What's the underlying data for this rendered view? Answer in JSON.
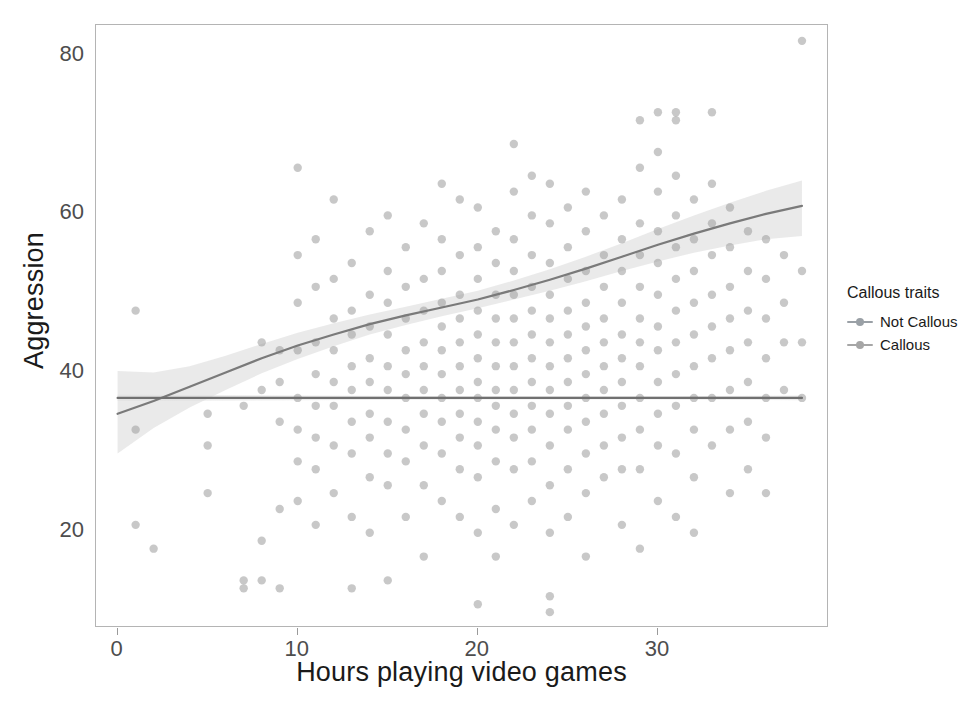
{
  "chart_data": {
    "type": "scatter",
    "title": "",
    "xlabel": "Hours playing video games",
    "ylabel": "Aggression",
    "xlim": [
      -1.2,
      39.5
    ],
    "ylim": [
      8,
      84
    ],
    "xticks": [
      0,
      10,
      20,
      30
    ],
    "yticks": [
      20,
      40,
      60,
      80
    ],
    "grid": false,
    "legend": {
      "title": "Callous traits",
      "position": "right",
      "entries": [
        {
          "label": "Not Callous",
          "color": "#9aa0a6",
          "marker": "line-point"
        },
        {
          "label": "Callous",
          "color": "#a6a6a6",
          "marker": "line-point"
        }
      ]
    },
    "point_style": {
      "color": "#9b9b9b",
      "opacity": 0.55,
      "radius": 4.2
    },
    "series": [
      {
        "name": "Not Callous",
        "fit": "loess",
        "line_color": "#7a7a7a",
        "ribbon_color": "#d9d9d9",
        "fit_points": [
          {
            "x": 0,
            "y": 35.0
          },
          {
            "x": 2,
            "y": 36.6
          },
          {
            "x": 4,
            "y": 38.4
          },
          {
            "x": 6,
            "y": 40.2
          },
          {
            "x": 8,
            "y": 42.0
          },
          {
            "x": 10,
            "y": 43.6
          },
          {
            "x": 12,
            "y": 45.0
          },
          {
            "x": 14,
            "y": 46.3
          },
          {
            "x": 16,
            "y": 47.4
          },
          {
            "x": 18,
            "y": 48.4
          },
          {
            "x": 20,
            "y": 49.4
          },
          {
            "x": 22,
            "y": 50.6
          },
          {
            "x": 24,
            "y": 51.9
          },
          {
            "x": 26,
            "y": 53.3
          },
          {
            "x": 28,
            "y": 54.8
          },
          {
            "x": 30,
            "y": 56.3
          },
          {
            "x": 32,
            "y": 57.7
          },
          {
            "x": 34,
            "y": 59.0
          },
          {
            "x": 36,
            "y": 60.2
          },
          {
            "x": 38,
            "y": 61.2
          }
        ],
        "ribbon_lower": [
          {
            "x": 0,
            "y": 30.0
          },
          {
            "x": 2,
            "y": 33.2
          },
          {
            "x": 4,
            "y": 35.8
          },
          {
            "x": 6,
            "y": 38.0
          },
          {
            "x": 8,
            "y": 40.1
          },
          {
            "x": 10,
            "y": 41.9
          },
          {
            "x": 12,
            "y": 43.5
          },
          {
            "x": 14,
            "y": 45.0
          },
          {
            "x": 16,
            "y": 46.2
          },
          {
            "x": 18,
            "y": 47.3
          },
          {
            "x": 20,
            "y": 48.3
          },
          {
            "x": 22,
            "y": 49.4
          },
          {
            "x": 24,
            "y": 50.5
          },
          {
            "x": 26,
            "y": 51.7
          },
          {
            "x": 28,
            "y": 53.0
          },
          {
            "x": 30,
            "y": 54.2
          },
          {
            "x": 32,
            "y": 55.3
          },
          {
            "x": 34,
            "y": 56.2
          },
          {
            "x": 36,
            "y": 57.0
          },
          {
            "x": 38,
            "y": 57.4
          }
        ],
        "ribbon_upper": [
          {
            "x": 0,
            "y": 40.4
          },
          {
            "x": 2,
            "y": 40.2
          },
          {
            "x": 4,
            "y": 41.0
          },
          {
            "x": 6,
            "y": 42.3
          },
          {
            "x": 8,
            "y": 43.8
          },
          {
            "x": 10,
            "y": 45.2
          },
          {
            "x": 12,
            "y": 46.4
          },
          {
            "x": 14,
            "y": 47.5
          },
          {
            "x": 16,
            "y": 48.5
          },
          {
            "x": 18,
            "y": 49.5
          },
          {
            "x": 20,
            "y": 50.5
          },
          {
            "x": 22,
            "y": 51.8
          },
          {
            "x": 24,
            "y": 53.2
          },
          {
            "x": 26,
            "y": 54.8
          },
          {
            "x": 28,
            "y": 56.5
          },
          {
            "x": 30,
            "y": 58.3
          },
          {
            "x": 32,
            "y": 60.0
          },
          {
            "x": 34,
            "y": 61.6
          },
          {
            "x": 36,
            "y": 63.1
          },
          {
            "x": 38,
            "y": 64.4
          }
        ]
      },
      {
        "name": "Callous",
        "fit": "loess",
        "line_color": "#707070",
        "ribbon_color": "#dedede",
        "fit_points": [
          {
            "x": 0,
            "y": 37.0
          },
          {
            "x": 5,
            "y": 37.0
          },
          {
            "x": 10,
            "y": 37.0
          },
          {
            "x": 15,
            "y": 37.0
          },
          {
            "x": 20,
            "y": 37.0
          },
          {
            "x": 25,
            "y": 37.0
          },
          {
            "x": 30,
            "y": 37.0
          },
          {
            "x": 35,
            "y": 37.0
          },
          {
            "x": 38,
            "y": 37.0
          }
        ],
        "ribbon_lower": [
          {
            "x": 0,
            "y": 36.6
          },
          {
            "x": 10,
            "y": 36.7
          },
          {
            "x": 20,
            "y": 36.8
          },
          {
            "x": 30,
            "y": 36.8
          },
          {
            "x": 38,
            "y": 36.7
          }
        ],
        "ribbon_upper": [
          {
            "x": 0,
            "y": 37.4
          },
          {
            "x": 10,
            "y": 37.3
          },
          {
            "x": 20,
            "y": 37.2
          },
          {
            "x": 30,
            "y": 37.2
          },
          {
            "x": 38,
            "y": 37.3
          }
        ]
      }
    ],
    "points": [
      [
        1,
        33
      ],
      [
        1,
        21
      ],
      [
        1,
        48
      ],
      [
        2,
        18
      ],
      [
        5,
        35
      ],
      [
        5,
        31
      ],
      [
        5,
        25
      ],
      [
        7,
        36
      ],
      [
        7,
        14
      ],
      [
        7,
        13
      ],
      [
        8,
        44
      ],
      [
        8,
        38
      ],
      [
        8,
        19
      ],
      [
        8,
        14
      ],
      [
        9,
        43
      ],
      [
        9,
        39
      ],
      [
        9,
        34
      ],
      [
        9,
        23
      ],
      [
        9,
        13
      ],
      [
        10,
        66
      ],
      [
        10,
        55
      ],
      [
        10,
        49
      ],
      [
        10,
        43
      ],
      [
        10,
        37
      ],
      [
        10,
        33
      ],
      [
        10,
        29
      ],
      [
        10,
        24
      ],
      [
        11,
        57
      ],
      [
        11,
        51
      ],
      [
        11,
        44
      ],
      [
        11,
        40
      ],
      [
        11,
        36
      ],
      [
        11,
        32
      ],
      [
        11,
        28
      ],
      [
        11,
        21
      ],
      [
        12,
        62
      ],
      [
        12,
        52
      ],
      [
        12,
        47
      ],
      [
        12,
        43
      ],
      [
        12,
        39
      ],
      [
        12,
        36
      ],
      [
        12,
        31
      ],
      [
        12,
        25
      ],
      [
        13,
        54
      ],
      [
        13,
        48
      ],
      [
        13,
        45
      ],
      [
        13,
        41
      ],
      [
        13,
        38
      ],
      [
        13,
        34
      ],
      [
        13,
        30
      ],
      [
        13,
        22
      ],
      [
        13,
        13
      ],
      [
        14,
        58
      ],
      [
        14,
        50
      ],
      [
        14,
        46
      ],
      [
        14,
        42
      ],
      [
        14,
        39
      ],
      [
        14,
        35
      ],
      [
        14,
        32
      ],
      [
        14,
        27
      ],
      [
        14,
        20
      ],
      [
        15,
        60
      ],
      [
        15,
        53
      ],
      [
        15,
        49
      ],
      [
        15,
        45
      ],
      [
        15,
        41
      ],
      [
        15,
        38
      ],
      [
        15,
        34
      ],
      [
        15,
        30
      ],
      [
        15,
        26
      ],
      [
        15,
        14
      ],
      [
        16,
        56
      ],
      [
        16,
        51
      ],
      [
        16,
        47
      ],
      [
        16,
        43
      ],
      [
        16,
        40
      ],
      [
        16,
        37
      ],
      [
        16,
        33
      ],
      [
        16,
        29
      ],
      [
        16,
        22
      ],
      [
        17,
        59
      ],
      [
        17,
        52
      ],
      [
        17,
        48
      ],
      [
        17,
        44
      ],
      [
        17,
        41
      ],
      [
        17,
        38
      ],
      [
        17,
        35
      ],
      [
        17,
        31
      ],
      [
        17,
        26
      ],
      [
        17,
        17
      ],
      [
        18,
        64
      ],
      [
        18,
        57
      ],
      [
        18,
        53
      ],
      [
        18,
        49
      ],
      [
        18,
        46
      ],
      [
        18,
        43
      ],
      [
        18,
        40
      ],
      [
        18,
        37
      ],
      [
        18,
        34
      ],
      [
        18,
        30
      ],
      [
        18,
        24
      ],
      [
        19,
        62
      ],
      [
        19,
        55
      ],
      [
        19,
        50
      ],
      [
        19,
        47
      ],
      [
        19,
        44
      ],
      [
        19,
        41
      ],
      [
        19,
        38
      ],
      [
        19,
        35
      ],
      [
        19,
        32
      ],
      [
        19,
        28
      ],
      [
        19,
        22
      ],
      [
        20,
        61
      ],
      [
        20,
        56
      ],
      [
        20,
        52
      ],
      [
        20,
        48
      ],
      [
        20,
        45
      ],
      [
        20,
        42
      ],
      [
        20,
        39
      ],
      [
        20,
        37
      ],
      [
        20,
        34
      ],
      [
        20,
        31
      ],
      [
        20,
        27
      ],
      [
        20,
        20
      ],
      [
        20,
        11
      ],
      [
        21,
        58
      ],
      [
        21,
        54
      ],
      [
        21,
        50
      ],
      [
        21,
        47
      ],
      [
        21,
        44
      ],
      [
        21,
        41
      ],
      [
        21,
        38
      ],
      [
        21,
        36
      ],
      [
        21,
        33
      ],
      [
        21,
        29
      ],
      [
        21,
        23
      ],
      [
        21,
        17
      ],
      [
        22,
        69
      ],
      [
        22,
        63
      ],
      [
        22,
        57
      ],
      [
        22,
        53
      ],
      [
        22,
        50
      ],
      [
        22,
        47
      ],
      [
        22,
        44
      ],
      [
        22,
        41
      ],
      [
        22,
        38
      ],
      [
        22,
        35
      ],
      [
        22,
        32
      ],
      [
        22,
        28
      ],
      [
        22,
        21
      ],
      [
        23,
        65
      ],
      [
        23,
        60
      ],
      [
        23,
        55
      ],
      [
        23,
        51
      ],
      [
        23,
        48
      ],
      [
        23,
        45
      ],
      [
        23,
        42
      ],
      [
        23,
        39
      ],
      [
        23,
        36
      ],
      [
        23,
        33
      ],
      [
        23,
        29
      ],
      [
        23,
        24
      ],
      [
        24,
        64
      ],
      [
        24,
        59
      ],
      [
        24,
        54
      ],
      [
        24,
        50
      ],
      [
        24,
        47
      ],
      [
        24,
        44
      ],
      [
        24,
        41
      ],
      [
        24,
        38
      ],
      [
        24,
        35
      ],
      [
        24,
        31
      ],
      [
        24,
        26
      ],
      [
        24,
        20
      ],
      [
        24,
        12
      ],
      [
        24,
        10
      ],
      [
        25,
        61
      ],
      [
        25,
        56
      ],
      [
        25,
        52
      ],
      [
        25,
        48
      ],
      [
        25,
        45
      ],
      [
        25,
        42
      ],
      [
        25,
        39
      ],
      [
        25,
        36
      ],
      [
        25,
        33
      ],
      [
        25,
        28
      ],
      [
        25,
        22
      ],
      [
        26,
        63
      ],
      [
        26,
        58
      ],
      [
        26,
        53
      ],
      [
        26,
        49
      ],
      [
        26,
        46
      ],
      [
        26,
        43
      ],
      [
        26,
        40
      ],
      [
        26,
        37
      ],
      [
        26,
        34
      ],
      [
        26,
        30
      ],
      [
        26,
        25
      ],
      [
        26,
        17
      ],
      [
        27,
        60
      ],
      [
        27,
        55
      ],
      [
        27,
        51
      ],
      [
        27,
        47
      ],
      [
        27,
        44
      ],
      [
        27,
        41
      ],
      [
        27,
        38
      ],
      [
        27,
        35
      ],
      [
        27,
        31
      ],
      [
        27,
        27
      ],
      [
        28,
        62
      ],
      [
        28,
        57
      ],
      [
        28,
        53
      ],
      [
        28,
        49
      ],
      [
        28,
        45
      ],
      [
        28,
        42
      ],
      [
        28,
        39
      ],
      [
        28,
        36
      ],
      [
        28,
        32
      ],
      [
        28,
        28
      ],
      [
        28,
        21
      ],
      [
        29,
        72
      ],
      [
        29,
        66
      ],
      [
        29,
        59
      ],
      [
        29,
        55
      ],
      [
        29,
        51
      ],
      [
        29,
        47
      ],
      [
        29,
        44
      ],
      [
        29,
        41
      ],
      [
        29,
        37
      ],
      [
        29,
        33
      ],
      [
        29,
        28
      ],
      [
        29,
        18
      ],
      [
        30,
        73
      ],
      [
        30,
        68
      ],
      [
        30,
        63
      ],
      [
        30,
        58
      ],
      [
        30,
        54
      ],
      [
        30,
        50
      ],
      [
        30,
        46
      ],
      [
        30,
        43
      ],
      [
        30,
        39
      ],
      [
        30,
        35
      ],
      [
        30,
        31
      ],
      [
        30,
        24
      ],
      [
        31,
        73
      ],
      [
        31,
        72
      ],
      [
        31,
        65
      ],
      [
        31,
        60
      ],
      [
        31,
        56
      ],
      [
        31,
        52
      ],
      [
        31,
        48
      ],
      [
        31,
        44
      ],
      [
        31,
        40
      ],
      [
        31,
        36
      ],
      [
        31,
        30
      ],
      [
        31,
        22
      ],
      [
        32,
        62
      ],
      [
        32,
        57
      ],
      [
        32,
        53
      ],
      [
        32,
        49
      ],
      [
        32,
        45
      ],
      [
        32,
        41
      ],
      [
        32,
        37
      ],
      [
        32,
        33
      ],
      [
        32,
        27
      ],
      [
        32,
        20
      ],
      [
        33,
        73
      ],
      [
        33,
        64
      ],
      [
        33,
        59
      ],
      [
        33,
        55
      ],
      [
        33,
        50
      ],
      [
        33,
        46
      ],
      [
        33,
        42
      ],
      [
        33,
        37
      ],
      [
        33,
        31
      ],
      [
        34,
        61
      ],
      [
        34,
        56
      ],
      [
        34,
        51
      ],
      [
        34,
        47
      ],
      [
        34,
        43
      ],
      [
        34,
        38
      ],
      [
        34,
        33
      ],
      [
        34,
        25
      ],
      [
        35,
        58
      ],
      [
        35,
        53
      ],
      [
        35,
        48
      ],
      [
        35,
        44
      ],
      [
        35,
        39
      ],
      [
        35,
        34
      ],
      [
        35,
        28
      ],
      [
        36,
        57
      ],
      [
        36,
        52
      ],
      [
        36,
        47
      ],
      [
        36,
        42
      ],
      [
        36,
        37
      ],
      [
        36,
        32
      ],
      [
        36,
        25
      ],
      [
        37,
        55
      ],
      [
        37,
        49
      ],
      [
        37,
        44
      ],
      [
        37,
        38
      ],
      [
        38,
        82
      ],
      [
        38,
        53
      ],
      [
        38,
        44
      ],
      [
        38,
        37
      ]
    ]
  }
}
